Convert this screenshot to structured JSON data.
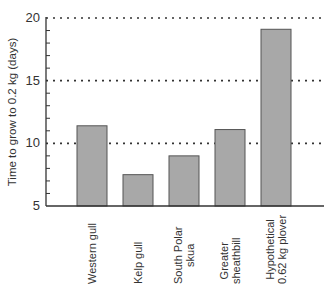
{
  "chart_data": {
    "type": "bar",
    "title": "",
    "xlabel": "",
    "ylabel": "Time to grow to 0.2 kg (days)",
    "ylim": [
      5,
      20
    ],
    "yticks": [
      5,
      10,
      15,
      20
    ],
    "grid": "dotted horizontal at 10, 15, 20",
    "categories": [
      "Western gull",
      "Kelp gull",
      "South Polar skua",
      "Greater sheathbill",
      "Hypothetical 0.62 kg plover"
    ],
    "category_lines": [
      [
        "Western gull"
      ],
      [
        "Kelp gull"
      ],
      [
        "South Polar",
        "skua"
      ],
      [
        "Greater",
        "sheathbill"
      ],
      [
        "Hypothetical",
        "0.62 kg plover"
      ]
    ],
    "values": [
      11.4,
      7.5,
      9.0,
      11.1,
      19.1
    ],
    "legend": null
  },
  "colors": {
    "bar_fill": "#a8a8a8",
    "bar_stroke": "#555555",
    "axis": "#333333",
    "grid": "#333333"
  }
}
